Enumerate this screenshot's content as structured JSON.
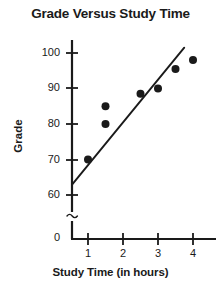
{
  "chart_data": {
    "type": "scatter",
    "title": "Grade Versus Study Time",
    "xlabel": "Study Time (in hours)",
    "ylabel": "Grade",
    "grid": false,
    "legend": "none",
    "xlim": [
      0,
      4.6
    ],
    "ylim": [
      57,
      104
    ],
    "x_ticks": [
      1,
      2,
      3,
      4
    ],
    "x_tick_labels": [
      "1",
      "2",
      "3",
      "4"
    ],
    "y_ticks": [
      60,
      70,
      80,
      90,
      100
    ],
    "y_tick_labels": [
      "60",
      "70",
      "80",
      "90",
      "100"
    ],
    "y_axis_break": true,
    "y_axis_break_symbol": "≈",
    "y_origin_label": "0",
    "series": [
      {
        "name": "Students",
        "type": "scatter",
        "marker": "filled-circle",
        "color": "#1a1a1a",
        "points": [
          {
            "x": 1,
            "y": 70
          },
          {
            "x": 1.5,
            "y": 85
          },
          {
            "x": 1.5,
            "y": 80
          },
          {
            "x": 2.5,
            "y": 88.5
          },
          {
            "x": 3,
            "y": 90
          },
          {
            "x": 3.5,
            "y": 95.5
          },
          {
            "x": 4,
            "y": 98
          }
        ]
      },
      {
        "name": "Line of best fit",
        "type": "line",
        "color": "#1a1a1a",
        "endpoints": [
          {
            "x": 0.55,
            "y": 63
          },
          {
            "x": 3.75,
            "y": 101.5
          }
        ]
      }
    ]
  },
  "axis_labels": {
    "y": [
      "100",
      "90",
      "80",
      "70",
      "60",
      "0"
    ],
    "x": [
      "1",
      "2",
      "3",
      "4"
    ],
    "break_symbol": "≈"
  },
  "colors": {
    "ink": "#1a1a1a",
    "background": "#ffffff"
  }
}
